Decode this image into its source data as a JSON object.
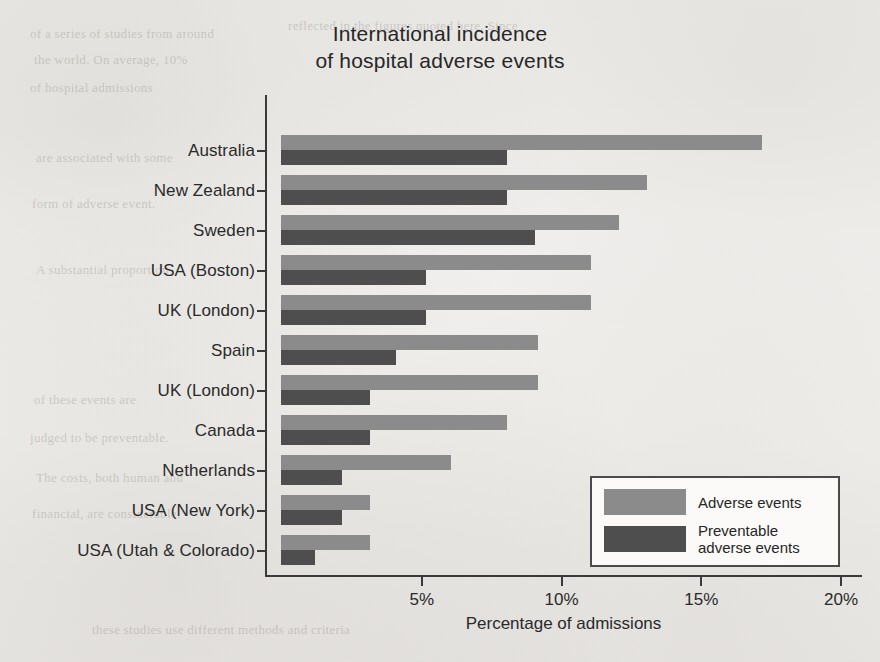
{
  "chart_data": {
    "type": "bar",
    "orientation": "horizontal",
    "title": "International incidence of hospital adverse events",
    "title_line1": "International incidence",
    "title_line2": "of hospital adverse events",
    "xlabel": "Percentage of admissions",
    "ylabel": "",
    "xlim": [
      0,
      20
    ],
    "xticks": [
      5,
      10,
      15,
      20
    ],
    "xtick_labels": [
      "5%",
      "10%",
      "15%",
      "20%"
    ],
    "grid": false,
    "legend_position": "lower right",
    "categories": [
      "Australia",
      "New Zealand",
      "Sweden",
      "USA (Boston)",
      "UK (London)",
      "Spain",
      "UK (London)",
      "Canada",
      "Netherlands",
      "USA (New York)",
      "USA (Utah & Colorado)"
    ],
    "series": [
      {
        "name": "Adverse events",
        "color": "#8b8b8b",
        "values": [
          17.2,
          13.1,
          12.1,
          11.1,
          11.1,
          9.2,
          9.2,
          8.1,
          6.1,
          3.2,
          3.2
        ]
      },
      {
        "name": "Preventable adverse events",
        "color": "#4e4e4e",
        "values": [
          8.1,
          8.1,
          9.1,
          5.2,
          5.2,
          4.1,
          3.2,
          3.2,
          2.2,
          2.2,
          1.2
        ]
      }
    ]
  },
  "legend": {
    "entries": [
      {
        "label": "Adverse events",
        "label_line1": "Adverse events",
        "label_line2": ""
      },
      {
        "label": "Preventable adverse events",
        "label_line1": "Preventable",
        "label_line2": "adverse events"
      }
    ]
  },
  "page_background_text": {
    "lines": [
      "of a series of studies from around",
      "the world. On average, 10%",
      "of hospital admissions",
      "are associated with some",
      "form of adverse event.",
      "A substantial proportion",
      "of these events are",
      "judged to be preventable.",
      "The costs, both human and",
      "financial, are considerable.",
      "reflected in the figures quoted here. Since",
      "these studies use different methods and criteria"
    ]
  }
}
